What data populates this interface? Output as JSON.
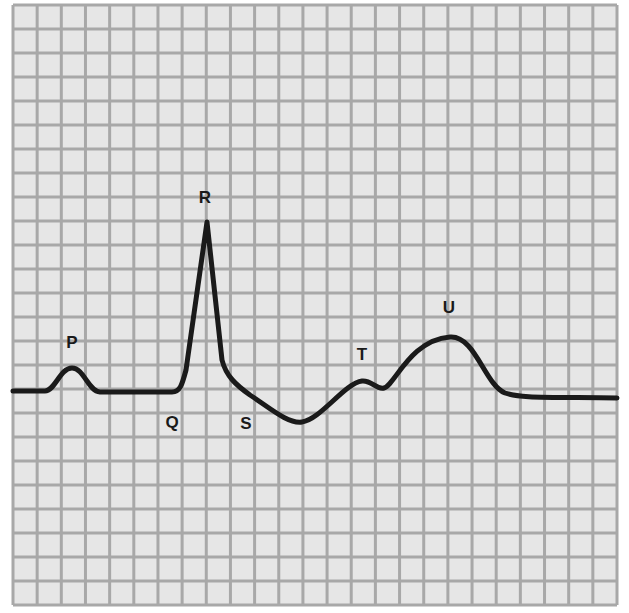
{
  "diagram": {
    "type": "ecg-waveform",
    "grid": {
      "left": 13,
      "top": 5,
      "right": 617,
      "bottom": 605,
      "cols": 25,
      "rows": 25,
      "background": "#e6e6e6",
      "line_color": "#a8a8a8"
    },
    "trace_color": "#1a1a1a",
    "labels": [
      {
        "id": "P",
        "text": "P",
        "x": 72,
        "y": 348
      },
      {
        "id": "Q",
        "text": "Q",
        "x": 172,
        "y": 428
      },
      {
        "id": "R",
        "text": "R",
        "x": 205,
        "y": 203
      },
      {
        "id": "S",
        "text": "S",
        "x": 246,
        "y": 429
      },
      {
        "id": "T",
        "text": "T",
        "x": 362,
        "y": 360
      },
      {
        "id": "U",
        "text": "U",
        "x": 449,
        "y": 313
      }
    ],
    "trace_path": "M 13 391 L 45 391 C 55 391 60 368 72 368 C 84 368 88 391 100 392 L 172 392 C 180 392 182 385 186 370 L 207 222 L 222 360 C 226 376 236 385 250 395 C 270 408 288 424 302 422 C 320 420 345 383 362 381 C 372 380 376 390 384 388 C 395 385 410 340 450 337 C 475 335 485 385 505 393 C 520 398 540 397 617 398"
  }
}
